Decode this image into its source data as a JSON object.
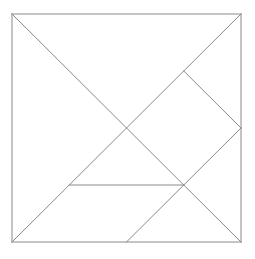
{
  "figure": {
    "name": "tangram-square-dissection",
    "background_color": "#ffffff",
    "line_color": "#8a8a8a",
    "outline_color": "#8a8a8a",
    "line_width": 1,
    "canvas": {
      "width": 255,
      "height": 259
    }
  },
  "square": {
    "left": 12,
    "top": 14,
    "right": 241,
    "bottom": 242,
    "width": 229,
    "height": 228
  },
  "chart_data": {
    "type": "diagram",
    "xlabel": "",
    "ylabel": "",
    "xlim": [
      0,
      1
    ],
    "ylim": [
      0,
      1
    ],
    "grid": false,
    "legend": "none",
    "coordinate_space": "normalized-unit-square",
    "points": {
      "top_left": [
        0.0,
        0.0
      ],
      "top_right": [
        1.0,
        0.0
      ],
      "bottom_left": [
        0.0,
        1.0
      ],
      "bottom_right": [
        1.0,
        1.0
      ],
      "center": [
        0.5,
        0.5
      ],
      "top_mid_right": [
        0.75,
        0.25
      ],
      "right_mid": [
        1.0,
        0.5
      ],
      "bottom_mid": [
        0.5,
        1.0
      ],
      "inner_left": [
        0.25,
        0.75
      ],
      "inner_right": [
        0.75,
        0.75
      ]
    },
    "segments": [
      {
        "name": "outline-top",
        "from": [
          0.0,
          0.0
        ],
        "to": [
          1.0,
          0.0
        ]
      },
      {
        "name": "outline-right",
        "from": [
          1.0,
          0.0
        ],
        "to": [
          1.0,
          1.0
        ]
      },
      {
        "name": "outline-bottom",
        "from": [
          1.0,
          1.0
        ],
        "to": [
          0.0,
          1.0
        ]
      },
      {
        "name": "outline-left",
        "from": [
          0.0,
          1.0
        ],
        "to": [
          0.0,
          0.0
        ]
      },
      {
        "name": "main-diagonal",
        "from": [
          0.0,
          0.0
        ],
        "to": [
          1.0,
          1.0
        ]
      },
      {
        "name": "anti-diagonal",
        "from": [
          1.0,
          0.0
        ],
        "to": [
          0.0,
          1.0
        ]
      },
      {
        "name": "small-triangle-edge",
        "from": [
          0.75,
          0.25
        ],
        "to": [
          1.0,
          0.5
        ]
      },
      {
        "name": "horizontal-chord",
        "from": [
          0.25,
          0.75
        ],
        "to": [
          0.75,
          0.75
        ]
      },
      {
        "name": "square-piece-edge",
        "from": [
          0.75,
          0.75
        ],
        "to": [
          1.0,
          0.5
        ]
      },
      {
        "name": "parallelogram-edge",
        "from": [
          0.5,
          1.0
        ],
        "to": [
          0.75,
          0.75
        ]
      }
    ],
    "pieces": [
      {
        "name": "large-triangle-upper-left",
        "vertices": [
          [
            0.0,
            0.0
          ],
          [
            1.0,
            0.0
          ],
          [
            0.5,
            0.5
          ]
        ]
      },
      {
        "name": "large-triangle-lower-left",
        "vertices": [
          [
            0.0,
            0.0
          ],
          [
            0.5,
            0.5
          ],
          [
            0.0,
            1.0
          ]
        ]
      },
      {
        "name": "medium-triangle",
        "vertices": [
          [
            1.0,
            0.0
          ],
          [
            1.0,
            0.5
          ],
          [
            0.75,
            0.25
          ]
        ]
      },
      {
        "name": "small-triangle-right",
        "vertices": [
          [
            0.75,
            0.25
          ],
          [
            1.0,
            0.5
          ],
          [
            0.75,
            0.75
          ]
        ]
      },
      {
        "name": "small-triangle-center",
        "vertices": [
          [
            0.5,
            0.5
          ],
          [
            0.75,
            0.75
          ],
          [
            0.25,
            0.75
          ]
        ]
      },
      {
        "name": "square-piece",
        "vertices": [
          [
            0.5,
            0.5
          ],
          [
            0.75,
            0.25
          ],
          [
            0.75,
            0.75
          ]
        ]
      },
      {
        "name": "parallelogram",
        "vertices": [
          [
            0.25,
            0.75
          ],
          [
            0.75,
            0.75
          ],
          [
            0.5,
            1.0
          ],
          [
            0.0,
            1.0
          ]
        ]
      }
    ],
    "piece_count": 7
  }
}
